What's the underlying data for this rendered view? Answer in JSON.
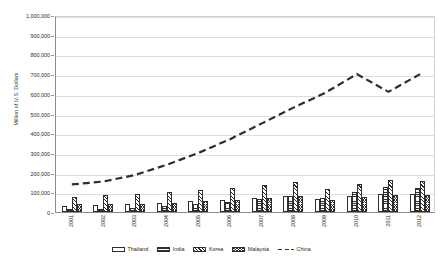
{
  "chart_data": {
    "type": "bar",
    "title": "",
    "subtitle": "",
    "xlabel": "",
    "ylabel": "Million of U.S. Dollars",
    "ylim": [
      0,
      1000000
    ],
    "y_tick_step": 100000,
    "y_ticks": [
      "0",
      "100,000",
      "200,000",
      "300,000",
      "400,000",
      "500,000",
      "600,000",
      "700,000",
      "800,000",
      "900,000",
      "1,000,000"
    ],
    "grid": true,
    "legend_position": "bottom",
    "categories": [
      "2001",
      "2002",
      "2003",
      "2004",
      "2005",
      "2006",
      "2007",
      "2008",
      "2009",
      "2010",
      "2011",
      "2012"
    ],
    "series": [
      {
        "name": "Thailand",
        "type": "bar",
        "pattern": "solid-white",
        "values": [
          32000,
          34000,
          40000,
          47000,
          55000,
          62000,
          72000,
          82000,
          64000,
          83000,
          90000,
          92000
        ]
      },
      {
        "name": "India",
        "type": "bar",
        "pattern": "horizontal-stripes",
        "values": [
          16000,
          17000,
          22000,
          30000,
          41000,
          52000,
          66000,
          81000,
          70000,
          101000,
          128000,
          120000
        ]
      },
      {
        "name": "Korea",
        "type": "bar",
        "pattern": "diagonal-stripes",
        "values": [
          75000,
          84000,
          90000,
          103000,
          110000,
          124000,
          137000,
          154000,
          116000,
          144000,
          164000,
          157000
        ]
      },
      {
        "name": "Malaysia",
        "type": "bar",
        "pattern": "crosshatch",
        "values": [
          39000,
          42000,
          43000,
          48000,
          56000,
          61000,
          69000,
          79000,
          60000,
          77000,
          84000,
          86000
        ]
      },
      {
        "name": "China",
        "type": "line",
        "style": "dashed",
        "values": [
          150000,
          165000,
          198000,
          250000,
          310000,
          380000,
          460000,
          540000,
          615000,
          710000,
          620000,
          710000
        ]
      }
    ]
  },
  "legend": {
    "items": [
      {
        "label": "Thailand",
        "swatch": "swatch-solid-white"
      },
      {
        "label": "India",
        "swatch": "swatch-horizontal-stripes"
      },
      {
        "label": "Korea",
        "swatch": "swatch-diagonal-stripes"
      },
      {
        "label": "Malaysia",
        "swatch": "swatch-crosshatch"
      },
      {
        "label": "China",
        "swatch": "swatch-dashed-line"
      }
    ]
  },
  "colors": {
    "ink": "#2e2e2e",
    "gridline": "#dedede",
    "axis": "#8c8c8c",
    "plot_background": "#ffffff"
  }
}
